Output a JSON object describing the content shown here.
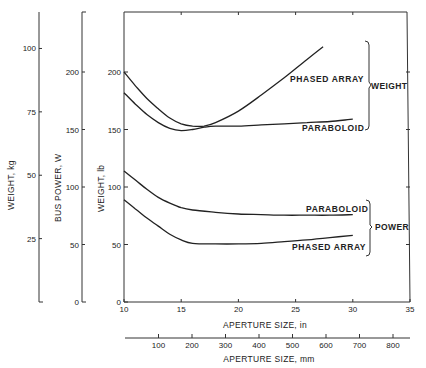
{
  "chart_data": {
    "type": "line",
    "title": "",
    "xlabel": "APERTURE SIZE, in",
    "xlabel_secondary": "APERTURE SIZE, mm",
    "ylabel_primary": "WEIGHT, lb",
    "ylabel_secondary_left": "BUS POWER, W",
    "ylabel_tertiary_left": "WEIGHT, kg",
    "xlim": [
      10,
      35
    ],
    "ylim": [
      0,
      250
    ],
    "grid": false,
    "x_ticks": [
      10,
      15,
      20,
      25,
      30,
      35
    ],
    "y_ticks_lb": [
      0,
      50,
      100,
      150,
      200
    ],
    "y_ticks_power_w": [
      0,
      50,
      100,
      150,
      200
    ],
    "y_ticks_kg": [
      25,
      50,
      75,
      100
    ],
    "x_ticks_mm": [
      100,
      200,
      300,
      400,
      500,
      600,
      700,
      800
    ],
    "groups": [
      {
        "name": "WEIGHT",
        "series": [
          "PHASED ARRAY",
          "PARABOLOID"
        ]
      },
      {
        "name": "POWER",
        "series": [
          "PARABOLOID",
          "PHASED ARRAY"
        ]
      }
    ],
    "series": [
      {
        "name": "PHASED ARRAY",
        "group": "WEIGHT",
        "x": [
          10,
          11,
          12,
          13,
          14,
          15,
          16,
          17,
          18,
          20,
          22,
          24,
          26,
          27.4
        ],
        "y": [
          200,
          188,
          177,
          168,
          160,
          155,
          153,
          153,
          156,
          166,
          180,
          195,
          211,
          222
        ]
      },
      {
        "name": "PARABOLOID",
        "group": "WEIGHT",
        "x": [
          10,
          11,
          12,
          13,
          14,
          15,
          16,
          17,
          18,
          20,
          22,
          24,
          26,
          28,
          30
        ],
        "y": [
          182,
          172,
          163,
          156,
          151,
          149,
          150,
          152,
          153,
          153,
          154,
          155,
          156,
          157,
          159
        ]
      },
      {
        "name": "PARABOLOID",
        "group": "POWER",
        "x": [
          10,
          11,
          12,
          13,
          14,
          15,
          16,
          18,
          20,
          22,
          24,
          26,
          28,
          30
        ],
        "y": [
          114,
          106,
          98,
          91,
          86,
          82,
          80,
          78,
          76.5,
          76,
          75.5,
          75.5,
          75.5,
          76
        ]
      },
      {
        "name": "PHASED ARRAY",
        "group": "POWER",
        "x": [
          10,
          11,
          12,
          13,
          14,
          15,
          16,
          18,
          20,
          22,
          24,
          26,
          28,
          30
        ],
        "y": [
          89,
          81,
          73,
          66,
          59,
          54,
          51,
          50.5,
          50.5,
          51,
          52.5,
          54,
          56,
          58
        ]
      }
    ]
  }
}
